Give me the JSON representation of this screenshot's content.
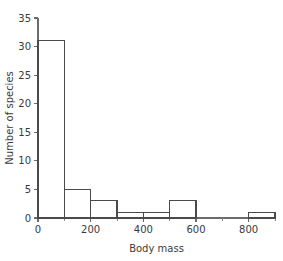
{
  "chart_data": {
    "type": "bar",
    "title": "",
    "xlabel": "Body mass",
    "ylabel": "Number of species",
    "categories": [
      "0-100",
      "100-200",
      "200-300",
      "300-400",
      "400-500",
      "500-600",
      "600-700",
      "700-800",
      "800-900"
    ],
    "bin_edges": [
      0,
      100,
      200,
      300,
      400,
      500,
      600,
      700,
      800,
      900
    ],
    "values": [
      31,
      5,
      3,
      1,
      1,
      3,
      0,
      0,
      1
    ],
    "bin_width": 100,
    "xlim": [
      0,
      900
    ],
    "ylim": [
      0,
      35
    ],
    "xticks": [
      0,
      200,
      400,
      600,
      800
    ],
    "xtick_labels": [
      "0",
      "200",
      "400",
      "600",
      "800"
    ],
    "xticks_minor": [
      100,
      300,
      500,
      700,
      900
    ],
    "yticks": [
      0,
      5,
      10,
      15,
      20,
      25,
      30,
      35
    ],
    "ytick_labels": [
      "0",
      "5",
      "10",
      "15",
      "20",
      "25",
      "30",
      "35"
    ],
    "grid": false,
    "legend": false,
    "bar_fill": "#ffffff",
    "bar_stroke": "#4a4a4a",
    "axis_color": "#6b6b6b",
    "background": "#ffffff"
  }
}
